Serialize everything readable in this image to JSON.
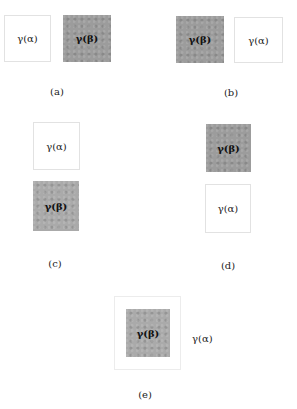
{
  "panels": {
    "a": {
      "caption": "(a)",
      "first": "γ(α)",
      "second": "γ(β)"
    },
    "b": {
      "caption": "(b)",
      "first": "γ(β)",
      "second": "γ(α)"
    },
    "c": {
      "caption": "(c)",
      "top": "γ(α)",
      "bottom": "γ(β)"
    },
    "d": {
      "caption": "(d)",
      "top": "γ(β)",
      "bottom": "γ(α)"
    },
    "e": {
      "caption": "(e)",
      "inner": "γ(β)",
      "outer": "γ(α)"
    }
  },
  "colors": {
    "alpha_fill": "#ffffff",
    "beta_fill": "#9c9c9c"
  }
}
